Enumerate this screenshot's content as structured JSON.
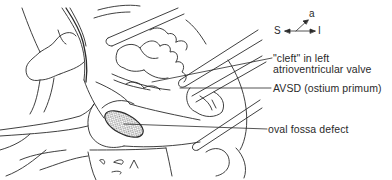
{
  "figure": {
    "type": "surgical anatomy line drawing"
  },
  "orientation": {
    "superior": "S",
    "inferior": "I",
    "anterior": "a"
  },
  "labels": [
    {
      "id": "cleft",
      "lines": [
        "\"cleft\" in left",
        "atrioventricular valve"
      ]
    },
    {
      "id": "avsd",
      "lines": [
        "AVSD (ostium primum)"
      ]
    },
    {
      "id": "oval-fossa",
      "lines": [
        "oval fossa defect"
      ]
    }
  ],
  "colors": {
    "ink": "#2a2a2a",
    "background": "#ffffff",
    "stipple": "#555555"
  }
}
